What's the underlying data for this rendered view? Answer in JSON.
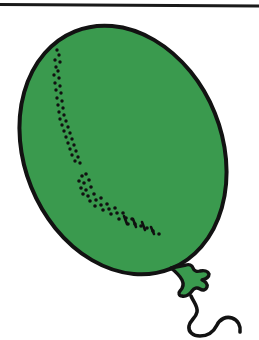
{
  "page": {
    "title": "Balloon",
    "width": 259,
    "height": 340,
    "background_color": "#ffffff"
  },
  "colors": {
    "background": "#ffffff",
    "ink": "#121212",
    "balloon_fill": "#3a9a4e",
    "balloon_fill_shade": "#34handled",
    "rule": "#1a1a1a",
    "stipple": "#101010"
  },
  "top_rule": {
    "name": "horizontal-rule",
    "x1": 0,
    "y1": 4.5,
    "x2": 259,
    "y2": 6.0,
    "thickness": 3.2,
    "color": "#1a1a1a"
  },
  "balloon": {
    "name": "balloon",
    "shape": "ellipse",
    "center_x": 123,
    "center_y": 150,
    "radius_x": 99,
    "radius_y": 128,
    "rotation_deg": -22,
    "fill": "#3a9a4e",
    "outline_color": "#121212",
    "outline_width": 4.0,
    "bounds": {
      "left": 26,
      "top": 24,
      "right": 221,
      "bottom": 275
    }
  },
  "knot": {
    "name": "balloon-knot",
    "center_x": 189,
    "center_y": 281,
    "fill": "#3a9a4e",
    "outline_color": "#121212",
    "outline_width": 3.4,
    "path": "M 171 268 C 176 272 180 276 182 280 C 184 284 183 288 180 291 C 178 293 179 296 182 296 C 186 297 190 294 192 291 C 194 288 197 287 200 289 C 203 291 206 290 207 287 C 208 284 205 281 202 280 C 206 279 209 277 209 274 C 208 271 204 270 200 271 C 197 272 194 271 193 268 C 192 265 189 264 186 265 Z"
  },
  "string": {
    "name": "balloon-string",
    "color": "#121212",
    "thickness": 3.6,
    "path": "M 191 296 C 194 303 198 306 197 312 C 196 318 190 320 189 326 C 188 332 193 336 200 336 C 208 336 214 331 217 325 C 220 319 226 316 232 318 C 238 320 241 326 240 332"
  },
  "stipple_groups": [
    {
      "name": "highlight-stipple-upper",
      "description": "vertical trail of small dots along the upper-left flank of the balloon",
      "dots": [
        [
          57,
          50
        ],
        [
          59,
          55
        ],
        [
          55,
          60
        ],
        [
          60,
          62
        ],
        [
          56,
          67
        ],
        [
          58,
          71
        ],
        [
          54,
          75
        ],
        [
          59,
          78
        ],
        [
          55,
          83
        ],
        [
          60,
          86
        ],
        [
          56,
          90
        ],
        [
          61,
          93
        ],
        [
          57,
          98
        ],
        [
          62,
          101
        ],
        [
          58,
          105
        ],
        [
          63,
          108
        ],
        [
          59,
          112
        ],
        [
          64,
          115
        ],
        [
          60,
          119
        ],
        [
          66,
          121
        ],
        [
          62,
          125
        ],
        [
          68,
          127
        ],
        [
          64,
          131
        ],
        [
          70,
          133
        ],
        [
          66,
          137
        ],
        [
          72,
          139
        ],
        [
          68,
          143
        ],
        [
          74,
          145
        ],
        [
          70,
          149
        ],
        [
          76,
          151
        ],
        [
          72,
          155
        ],
        [
          78,
          157
        ],
        [
          75,
          161
        ],
        [
          80,
          163
        ]
      ],
      "dot_radius": 1.7
    },
    {
      "name": "highlight-stipple-lower",
      "description": "curved sweeping trail of dots from mid-left down toward lower-right of the balloon",
      "dots": [
        [
          82,
          176
        ],
        [
          86,
          174
        ],
        [
          79,
          181
        ],
        [
          84,
          183
        ],
        [
          89,
          180
        ],
        [
          81,
          188
        ],
        [
          86,
          190
        ],
        [
          91,
          187
        ],
        [
          83,
          194
        ],
        [
          88,
          196
        ],
        [
          94,
          194
        ],
        [
          90,
          201
        ],
        [
          96,
          200
        ],
        [
          101,
          198
        ],
        [
          95,
          206
        ],
        [
          101,
          205
        ],
        [
          107,
          204
        ],
        [
          103,
          210
        ],
        [
          109,
          209
        ],
        [
          115,
          208
        ],
        [
          111,
          214
        ],
        [
          117,
          213
        ],
        [
          123,
          213
        ],
        [
          119,
          219
        ],
        [
          126,
          218
        ],
        [
          132,
          219
        ],
        [
          128,
          224
        ],
        [
          135,
          224
        ],
        [
          141,
          226
        ],
        [
          147,
          228
        ],
        [
          153,
          231
        ],
        [
          159,
          234
        ]
      ],
      "dot_radius": 1.8
    },
    {
      "name": "highlight-stipple-dashes",
      "description": "short dash strokes near the lower-right end of the curved highlight trail",
      "dashes": [
        {
          "x1": 124,
          "y1": 216,
          "x2": 127,
          "y2": 224
        },
        {
          "x1": 133,
          "y1": 219,
          "x2": 136,
          "y2": 227
        },
        {
          "x1": 142,
          "y1": 222,
          "x2": 145,
          "y2": 230
        },
        {
          "x1": 151,
          "y1": 227,
          "x2": 154,
          "y2": 234
        }
      ],
      "thickness": 2.6
    }
  ]
}
